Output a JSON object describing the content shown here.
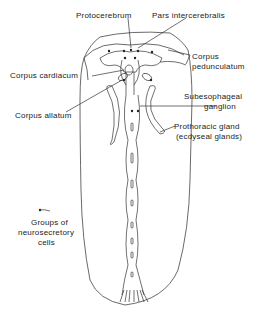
{
  "diagram": {
    "labels": {
      "protocerebrum": "Protocerebrum",
      "pars_intercerebralis": "Pars intercerebralis",
      "corpus_pedunculatum_1": "Corpus",
      "corpus_pedunculatum_2": "pedunculatum",
      "corpus_cardiacum": "Corpus cardiacum",
      "subesophageal_1": "Subesophageal",
      "subesophageal_2": "ganglion",
      "corpus_allatum": "Corpus allatum",
      "prothoracic_1": "Prothoracic gland",
      "prothoracic_2": "(ecdyseal glands)",
      "legend_1": "Groups of",
      "legend_2": "neurosecretory",
      "legend_3": "cells"
    },
    "colors": {
      "line": "#333333",
      "background": "#ffffff"
    }
  }
}
